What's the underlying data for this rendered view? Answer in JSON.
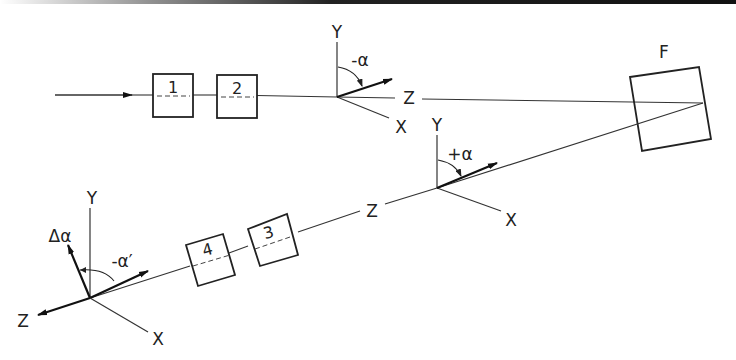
{
  "diagram": {
    "labels": {
      "box1": "1",
      "box2": "2",
      "box3": "3",
      "box4": "4",
      "target": "F",
      "frame1": {
        "y": "Y",
        "z": "Z",
        "x": "X",
        "angle": "-α"
      },
      "frame2": {
        "y": "Y",
        "z": "Z",
        "x": "X",
        "angle": "+α"
      },
      "frame3": {
        "y": "Y",
        "z": "Z",
        "x": "X",
        "angle": "-α′",
        "delta": "Δα"
      }
    },
    "colors": {
      "line": "#333333",
      "background": "#ffffff"
    }
  }
}
